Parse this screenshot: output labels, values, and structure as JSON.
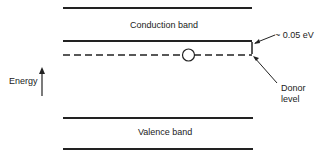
{
  "diagram": {
    "conduction_band_label": "Conduction band",
    "valence_band_label": "Valence band",
    "energy_label": "Energy",
    "gap_label": "~ 0.05 eV",
    "donor_label_line1": "Donor",
    "donor_label_line2": "level"
  }
}
